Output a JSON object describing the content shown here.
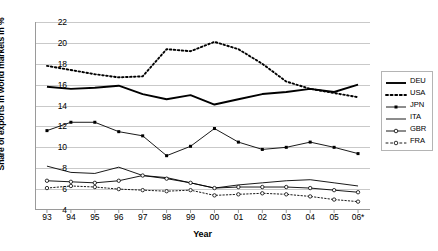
{
  "chart_data": {
    "type": "line",
    "title": "",
    "xlabel": "Year",
    "ylabel": "Share of exports in world markets in %",
    "categories": [
      "93",
      "94",
      "95",
      "96",
      "97",
      "98",
      "99",
      "00",
      "01",
      "02",
      "03",
      "04",
      "05",
      "06*"
    ],
    "ylim": [
      4,
      22
    ],
    "ytick_values": [
      4,
      6,
      8,
      10,
      12,
      14,
      16,
      18,
      20,
      22
    ],
    "grid": true,
    "legend_position": "right",
    "series": [
      {
        "name": "DEU",
        "style": "solid-thick",
        "color": "#000000",
        "values": [
          15.8,
          15.6,
          15.7,
          15.9,
          15.1,
          14.6,
          15.0,
          14.1,
          14.6,
          15.1,
          15.3,
          15.6,
          15.3,
          16.0
        ]
      },
      {
        "name": "USA",
        "style": "dotted",
        "color": "#000000",
        "values": [
          17.8,
          17.4,
          17.0,
          16.7,
          16.8,
          19.4,
          19.2,
          20.1,
          19.4,
          18.0,
          16.3,
          15.6,
          15.2,
          14.8
        ]
      },
      {
        "name": "JPN",
        "style": "solid-marker",
        "color": "#000000",
        "values": [
          11.6,
          12.4,
          12.4,
          11.5,
          11.1,
          9.2,
          10.1,
          11.8,
          10.5,
          9.8,
          10.0,
          10.5,
          10.0,
          9.4
        ]
      },
      {
        "name": "ITA",
        "style": "solid-thin",
        "color": "#000000",
        "values": [
          8.2,
          7.6,
          7.5,
          8.1,
          7.3,
          7.1,
          6.6,
          6.1,
          6.4,
          6.6,
          6.8,
          6.9,
          6.6,
          6.3
        ]
      },
      {
        "name": "GBR",
        "style": "solid-circle",
        "color": "#000000",
        "values": [
          6.8,
          6.7,
          6.6,
          6.8,
          7.3,
          7.0,
          6.6,
          6.1,
          6.2,
          6.2,
          6.2,
          6.1,
          5.9,
          5.7
        ]
      },
      {
        "name": "FRA",
        "style": "dotted-circle",
        "color": "#000000",
        "values": [
          6.1,
          6.3,
          6.2,
          6.0,
          5.9,
          5.8,
          5.9,
          5.4,
          5.5,
          5.6,
          5.5,
          5.3,
          5.0,
          4.8
        ]
      }
    ]
  },
  "legend": {
    "entries": [
      {
        "label": "DEU"
      },
      {
        "label": "USA"
      },
      {
        "label": "JPN"
      },
      {
        "label": "ITA"
      },
      {
        "label": "GBR"
      },
      {
        "label": "FRA"
      }
    ]
  }
}
